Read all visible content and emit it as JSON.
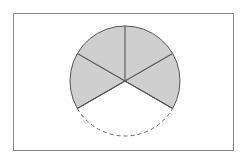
{
  "diagram": {
    "type": "circle-sectors",
    "frame": {
      "x": 13,
      "y": 13,
      "width": 220,
      "height": 137,
      "stroke": "#8a8a8a"
    },
    "circle": {
      "cx": 125,
      "cy": 81,
      "r": 55
    },
    "total_sectors": 6,
    "shaded_sectors": 4,
    "unshaded_sectors": 2,
    "colors": {
      "shaded_fill": "#cfcfcf",
      "line": "#555555",
      "dashed_arc": "#666666",
      "background": "#ffffff"
    }
  }
}
